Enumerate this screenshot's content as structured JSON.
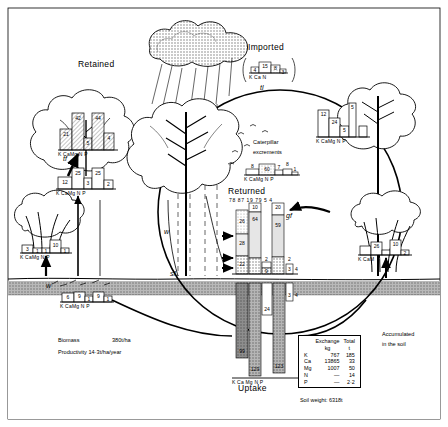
{
  "figure": {
    "elements": [
      "K",
      "Ca",
      "Mg",
      "N",
      "P"
    ],
    "element_axis_label": "K CaMg N  P"
  },
  "labels": {
    "retained": "Retained",
    "imported": "Imported",
    "returned": "Returned",
    "uptake": "Uptake",
    "caterpillar": "Caterpillar",
    "excrements": "excrements",
    "accumulated_line1": "Accumulated",
    "accumulated_line2": "in the soil",
    "biomass": "Biomass",
    "biomass_value": "380t/ha",
    "productivity": "Productivity 14·3t/ha/year",
    "soil_weight": "Soil weight: 6318t",
    "tl": "tl",
    "gf": "gf",
    "sf": "sf",
    "tf": "tf",
    "w_left": "w",
    "w_mid": "w"
  },
  "canopy_retained": {
    "name": "Retained canopy compartment",
    "values": [
      21,
      42,
      5,
      44,
      4
    ],
    "axis": "K CaMg N  P"
  },
  "trunk_retained": {
    "name": "Retained trunk compartment",
    "values": [
      12,
      25,
      3,
      25,
      2
    ],
    "axis": "K CaMg N  P"
  },
  "shrub_left": {
    "name": "Left understory shrub compartment",
    "values": [
      3,
      1,
      1,
      10,
      1
    ],
    "axis": "K CaMg N  P"
  },
  "litter_left": {
    "name": "Left ground litter compartment",
    "values": [
      6,
      9,
      1,
      9,
      1
    ],
    "axis": "K CaMg N  P"
  },
  "imported": {
    "name": "Imported via rainfall",
    "values": [
      4,
      15,
      8,
      3
    ],
    "axis": "K Ca N"
  },
  "caterpillar_excrements": {
    "name": "Caterpillar excrements",
    "values": [
      8,
      60,
      7,
      8,
      1
    ],
    "axis": "K CaMg N  P"
  },
  "canopy_right": {
    "name": "Right canopy compartment",
    "values": [
      12,
      24,
      5,
      5
    ],
    "axis": "K CaMg N  P"
  },
  "shrub_right": {
    "name": "Right understory shrub compartment",
    "values": [
      26,
      10,
      2
    ],
    "axis": "K CaM"
  },
  "returned": {
    "name": "Returned flux values",
    "values": [
      78,
      87,
      19,
      79,
      5,
      4
    ],
    "text": "78 87 19 79 5 4"
  },
  "returned_bars": {
    "name": "Returned stacked bars",
    "segments": [
      {
        "label": "26"
      },
      {
        "label": "28"
      },
      {
        "label": "22"
      },
      {
        "label": "10"
      },
      {
        "label": "64"
      },
      {
        "label": "20"
      },
      {
        "label": "59"
      },
      {
        "label": "2"
      },
      {
        "label": "9"
      },
      {
        "label": "2"
      },
      {
        "label": "3"
      },
      {
        "label": "4"
      }
    ]
  },
  "uptake": {
    "name": "Uptake bars",
    "values": [
      99,
      129,
      24,
      123,
      3,
      4
    ],
    "axis": "K  Ca Mg N   P"
  },
  "soil_table": {
    "name": "Soil nutrient table",
    "headers": [
      "",
      "Exchange",
      "Total"
    ],
    "subheaders": [
      "",
      "kg",
      "t"
    ],
    "rows": [
      {
        "element": "K",
        "exchange": "767",
        "total": "185"
      },
      {
        "element": "Ca",
        "exchange": "13865",
        "total": "33"
      },
      {
        "element": "Mg",
        "exchange": "1007",
        "total": "50"
      },
      {
        "element": "N",
        "exchange": "—",
        "total": "14"
      },
      {
        "element": "P",
        "exchange": "—",
        "total": "2·2"
      }
    ]
  },
  "colors": {
    "ink": "#000000",
    "soil_band": "#b9b9b9",
    "soil_dark": "#8f8f8f",
    "hatch": "#d9d9d9",
    "cloud": "#cfcfcf"
  }
}
